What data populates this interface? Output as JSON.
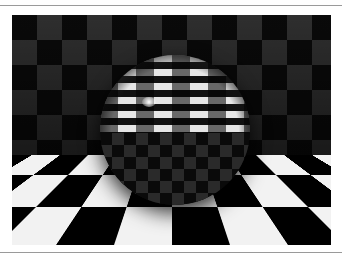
{
  "image": {
    "subject": "ray-traced reflective sphere on checkerboard floor",
    "alt": "Glossy sphere reflecting a black and white checkerboard floor in front of a dark checkered wall"
  }
}
